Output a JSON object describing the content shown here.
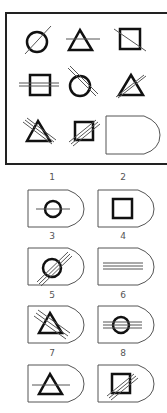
{
  "puzzle": {
    "grid": [
      {
        "row": 1,
        "col": 1,
        "shape": "circle",
        "lines": 1,
        "line_orientation": "diagonal"
      },
      {
        "row": 1,
        "col": 2,
        "shape": "triangle",
        "lines": 1,
        "line_orientation": "horizontal"
      },
      {
        "row": 1,
        "col": 3,
        "shape": "square",
        "lines": 1,
        "line_orientation": "diagonal-down"
      },
      {
        "row": 2,
        "col": 1,
        "shape": "square",
        "lines": 2,
        "line_orientation": "horizontal"
      },
      {
        "row": 2,
        "col": 2,
        "shape": "circle",
        "lines": 2,
        "line_orientation": "diagonal-down"
      },
      {
        "row": 2,
        "col": 3,
        "shape": "triangle",
        "lines": 2,
        "line_orientation": "diagonal"
      },
      {
        "row": 3,
        "col": 1,
        "shape": "triangle",
        "lines": 3,
        "line_orientation": "diagonal-down"
      },
      {
        "row": 3,
        "col": 2,
        "shape": "square",
        "lines": 3,
        "line_orientation": "diagonal"
      },
      {
        "row": 3,
        "col": 3,
        "shape": "blank",
        "lines": 0,
        "line_orientation": "none"
      }
    ],
    "colors": {
      "stroke": "#111111",
      "line": "#555555",
      "frame": "#222222"
    }
  },
  "options": [
    {
      "label": "1",
      "shape": "circle",
      "lines": 1,
      "line_orientation": "horizontal"
    },
    {
      "label": "2",
      "shape": "square",
      "lines": 0,
      "line_orientation": "none"
    },
    {
      "label": "3",
      "shape": "circle",
      "lines": 3,
      "line_orientation": "diagonal"
    },
    {
      "label": "4",
      "shape": "none",
      "lines": 3,
      "line_orientation": "horizontal"
    },
    {
      "label": "5",
      "shape": "triangle",
      "lines": 3,
      "line_orientation": "diagonal-down"
    },
    {
      "label": "6",
      "shape": "circle",
      "lines": 3,
      "line_orientation": "horizontal"
    },
    {
      "label": "7",
      "shape": "triangle",
      "lines": 1,
      "line_orientation": "horizontal"
    },
    {
      "label": "8",
      "shape": "square",
      "lines": 3,
      "line_orientation": "diagonal"
    }
  ]
}
